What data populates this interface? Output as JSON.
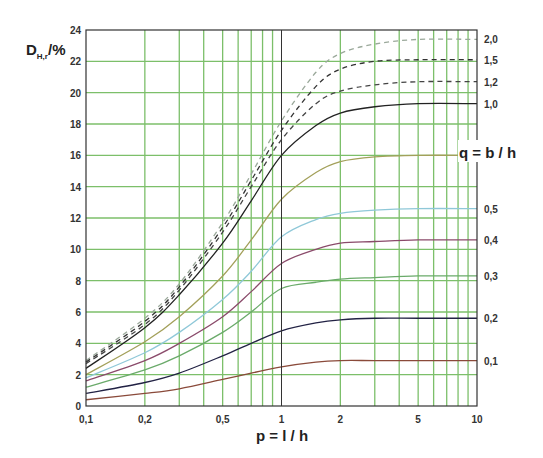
{
  "chart_data": {
    "type": "line",
    "title": "",
    "xlabel": "p = l / h",
    "ylabel": "D",
    "ylabel_sub": "H,r",
    "ylabel_unit": "/%",
    "series_label": "q = b / h",
    "x_scale": "log",
    "xlim": [
      0.1,
      10
    ],
    "ylim": [
      0,
      24
    ],
    "grid": true,
    "legend_position": "right (inline curve labels)",
    "x_ticks": [
      {
        "value": 0.1,
        "label": "0,1"
      },
      {
        "value": 0.2,
        "label": "0,2"
      },
      {
        "value": 0.5,
        "label": "0,5"
      },
      {
        "value": 1,
        "label": "1"
      },
      {
        "value": 2,
        "label": "2"
      },
      {
        "value": 5,
        "label": "5"
      },
      {
        "value": 10,
        "label": "10"
      }
    ],
    "x_gridlines": [
      0.2,
      0.3,
      0.4,
      0.5,
      0.6,
      0.7,
      0.8,
      0.9,
      1,
      2,
      3,
      4,
      5,
      6,
      7,
      8,
      9
    ],
    "y_ticks": [
      0,
      2,
      4,
      6,
      8,
      10,
      12,
      14,
      16,
      18,
      20,
      22,
      24
    ],
    "x": [
      0.1,
      0.2,
      0.3,
      0.5,
      0.7,
      1,
      1.5,
      2,
      3,
      5,
      10
    ],
    "series": [
      {
        "name": "2,0",
        "q": 2.0,
        "style": "dashed",
        "color": "#9aa89a",
        "values": [
          2.9,
          5.6,
          7.8,
          11.7,
          14.8,
          18.2,
          21.3,
          22.5,
          23.1,
          23.4,
          23.4
        ]
      },
      {
        "name": "1,5",
        "q": 1.5,
        "style": "dashed",
        "color": "#333333",
        "values": [
          2.8,
          5.4,
          7.6,
          11.4,
          14.4,
          17.6,
          20.4,
          21.5,
          22.0,
          22.1,
          22.1
        ]
      },
      {
        "name": "1,2",
        "q": 1.2,
        "style": "dashed",
        "color": "#444444",
        "values": [
          2.7,
          5.2,
          7.4,
          11.1,
          14.0,
          17.0,
          19.3,
          20.1,
          20.5,
          20.7,
          20.7
        ]
      },
      {
        "name": "1,0",
        "q": 1.0,
        "style": "solid",
        "color": "#222222",
        "values": [
          2.4,
          5.0,
          7.1,
          10.4,
          13.1,
          16.0,
          17.9,
          18.7,
          19.1,
          19.3,
          19.3
        ]
      },
      {
        "name": "0,7",
        "q": 0.7,
        "style": "solid",
        "color": "#a3a05a",
        "values": [
          2.0,
          4.1,
          5.7,
          8.3,
          10.6,
          13.2,
          14.9,
          15.6,
          15.9,
          16.0,
          16.0
        ]
      },
      {
        "name": "0,5",
        "q": 0.5,
        "style": "solid",
        "color": "#8fc8d8",
        "values": [
          1.8,
          3.4,
          4.7,
          6.8,
          8.6,
          10.8,
          11.9,
          12.3,
          12.5,
          12.6,
          12.6
        ]
      },
      {
        "name": "0,4",
        "q": 0.4,
        "style": "solid",
        "color": "#8a4a6a",
        "values": [
          1.6,
          2.9,
          4.0,
          5.7,
          7.3,
          9.1,
          10.0,
          10.4,
          10.5,
          10.6,
          10.6
        ]
      },
      {
        "name": "0,3",
        "q": 0.3,
        "style": "solid",
        "color": "#6aaa6a",
        "values": [
          1.2,
          2.3,
          3.2,
          4.7,
          6.0,
          7.5,
          7.9,
          8.1,
          8.2,
          8.3,
          8.3
        ]
      },
      {
        "name": "0,2",
        "q": 0.2,
        "style": "solid",
        "color": "#222244",
        "values": [
          0.8,
          1.5,
          2.1,
          3.2,
          4.0,
          4.8,
          5.3,
          5.5,
          5.6,
          5.6,
          5.6
        ]
      },
      {
        "name": "0,1",
        "q": 0.1,
        "style": "solid",
        "color": "#8a4a3a",
        "values": [
          0.4,
          0.8,
          1.1,
          1.7,
          2.1,
          2.5,
          2.8,
          2.9,
          2.9,
          2.9,
          2.9
        ]
      }
    ]
  },
  "labels": {
    "y_title_main": "D",
    "y_title_sub": "H,r",
    "y_title_unit": "/%",
    "x_title": "p = l / h",
    "q_title": "q = b / h"
  },
  "colors": {
    "grid": "#7cbf6a",
    "frame": "#333333",
    "text": "#333333"
  }
}
